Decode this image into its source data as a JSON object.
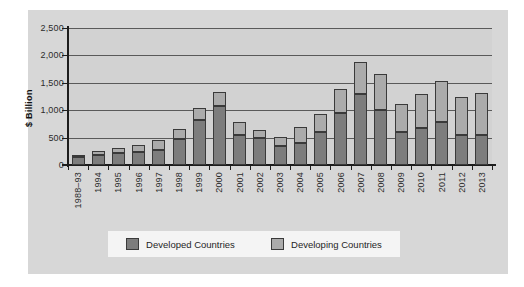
{
  "chart_data": {
    "type": "bar",
    "stacked": true,
    "title": "",
    "xlabel": "",
    "ylabel": "$ Billion",
    "ylim": [
      0,
      2500
    ],
    "yticks": [
      "0",
      "500",
      "1,000",
      "1,500",
      "2,000",
      "2,500"
    ],
    "ytick_values": [
      0,
      500,
      1000,
      1500,
      2000,
      2500
    ],
    "grid": true,
    "legend_position": "bottom",
    "categories": [
      "1988–93",
      "1994",
      "1995",
      "1996",
      "1997",
      "1998",
      "1999",
      "2000",
      "2001",
      "2002",
      "2003",
      "2004",
      "2005",
      "2006",
      "2007",
      "2008",
      "2009",
      "2010",
      "2011",
      "2012",
      "2013"
    ],
    "series": [
      {
        "name": "Developed Countries",
        "color": "#7d7d7d",
        "values": [
          150,
          175,
          215,
          230,
          275,
          470,
          820,
          1085,
          555,
          495,
          350,
          405,
          610,
          950,
          1295,
          1010,
          595,
          675,
          790,
          540,
          540
        ]
      },
      {
        "name": "Developing Countries",
        "color": "#ababab",
        "values": [
          40,
          80,
          100,
          140,
          180,
          195,
          220,
          255,
          225,
          140,
          170,
          280,
          325,
          440,
          585,
          655,
          525,
          630,
          740,
          700,
          770
        ]
      }
    ],
    "totals": [
      190,
      255,
      315,
      370,
      455,
      665,
      1040,
      1340,
      780,
      635,
      520,
      685,
      935,
      1390,
      1880,
      1665,
      1120,
      1305,
      1530,
      1240,
      1310
    ]
  },
  "legend": {
    "items": [
      {
        "label": "Developed Countries",
        "swatch": "developed"
      },
      {
        "label": "Developing Countries",
        "swatch": "developing"
      }
    ]
  }
}
